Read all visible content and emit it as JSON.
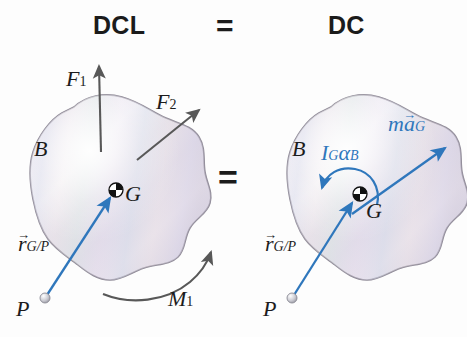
{
  "figure": {
    "title_left": "DCL",
    "equals_top": "=",
    "title_right": "DC",
    "equals_middle": "=",
    "background_color": "#fdfdfd",
    "body_fill_color": "#ded9e6",
    "body_outline_color": "#8f8a97",
    "force_arrow_color": "#585858",
    "inertia_arrow_color": "#2f77bc",
    "point_marker_color": "#c9c9cf"
  },
  "left_diagram": {
    "name": "free-body-diagram",
    "body_label": "B",
    "cg_label": "G",
    "point_label": "P",
    "position_vector": {
      "base": "r",
      "sub": "G/P"
    },
    "forces": [
      {
        "base": "F",
        "sub": "1"
      },
      {
        "base": "F",
        "sub": "2"
      }
    ],
    "moment": {
      "base": "M",
      "sub": "1"
    }
  },
  "right_diagram": {
    "name": "kinetic-diagram",
    "body_label": "B",
    "cg_label": "G",
    "point_label": "P",
    "position_vector": {
      "base": "r",
      "sub": "G/P"
    },
    "angular_term": {
      "inertia": "I",
      "inertia_sub": "G",
      "alpha": "α",
      "alpha_sub": "B"
    },
    "linear_term": {
      "mass": "m",
      "accel": "a",
      "accel_sub": "G"
    }
  }
}
